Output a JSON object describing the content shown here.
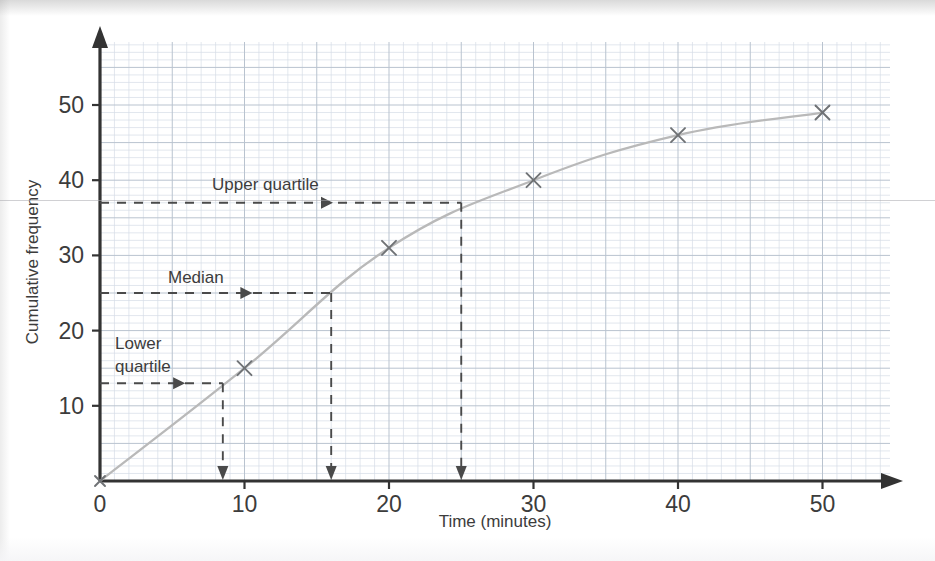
{
  "chart_data": {
    "type": "line",
    "title": "",
    "xlabel": "Time (minutes)",
    "ylabel": "Cumulative frequency",
    "xlim": [
      0,
      55
    ],
    "ylim": [
      0,
      58
    ],
    "xticks": [
      0,
      10,
      20,
      30,
      40,
      50
    ],
    "yticks": [
      10,
      20,
      30,
      40,
      50
    ],
    "xtick_labels": [
      "0",
      "10",
      "20",
      "30",
      "40",
      "50"
    ],
    "ytick_labels": [
      "10",
      "20",
      "30",
      "40",
      "50"
    ],
    "grid": true,
    "grid_minor_step": 1,
    "grid_major_step": 5,
    "legend": "none",
    "series": [
      {
        "name": "Cumulative frequency",
        "marker": "x",
        "x": [
          0,
          10,
          20,
          30,
          40,
          50
        ],
        "values": [
          0,
          15,
          31,
          40,
          46,
          49
        ]
      }
    ],
    "annotations": [
      {
        "name": "upper-quartile",
        "label": "Upper quartile",
        "y": 37,
        "x": 25,
        "label_x": 16,
        "label_y": 40.5
      },
      {
        "name": "median",
        "label": "Median",
        "y": 25,
        "x": 16,
        "label_x": 7.5,
        "label_y": 28.5
      },
      {
        "name": "lower-quartile",
        "label": "Lower quartile",
        "label_line_1": "Lower",
        "label_line_2": "quartile",
        "y": 13,
        "x": 8.5,
        "label_x": 1.5,
        "label_y": 19.5
      }
    ]
  },
  "colors": {
    "curve": "#b9b9b9",
    "marker": "#6f7275",
    "axis": "#333333",
    "guide": "#4a4a4a",
    "grid_minor": "#d6dde6",
    "grid_major": "#b9c3cf",
    "text": "#3c3c3c",
    "background": "#ffffff"
  }
}
